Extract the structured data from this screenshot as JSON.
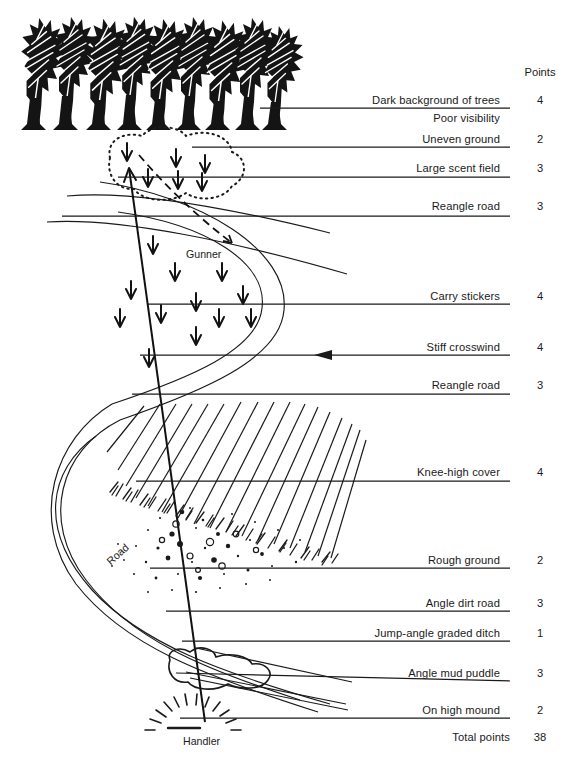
{
  "figure": {
    "title_column": "Points",
    "total_label": "Total points",
    "total_value": "38"
  },
  "legend_rows": [
    {
      "label": "Dark background of trees",
      "points": "4",
      "has_line": true,
      "label_y": 94,
      "line_y": 108,
      "label_right": 500
    },
    {
      "label": "Poor visibility",
      "points": "",
      "has_line": false,
      "label_y": 112,
      "line_y": 0,
      "label_right": 500
    },
    {
      "label": "Uneven ground",
      "points": "2",
      "has_line": true,
      "label_y": 133,
      "line_y": 147,
      "label_right": 500
    },
    {
      "label": "Large scent field",
      "points": "3",
      "has_line": true,
      "label_y": 162,
      "line_y": 177,
      "label_right": 500
    },
    {
      "label": "Reangle road",
      "points": "3",
      "has_line": true,
      "label_y": 200,
      "line_y": 216,
      "label_right": 500
    },
    {
      "label": "Carry stickers",
      "points": "4",
      "has_line": true,
      "label_y": 290,
      "line_y": 304,
      "label_right": 500
    },
    {
      "label": "Stiff crosswind",
      "points": "4",
      "has_line": true,
      "label_y": 341,
      "line_y": 355,
      "label_right": 500
    },
    {
      "label": "Reangle road",
      "points": "3",
      "has_line": true,
      "label_y": 379,
      "line_y": 394,
      "label_right": 500
    },
    {
      "label": "Knee-high cover",
      "points": "4",
      "has_line": true,
      "label_y": 466,
      "line_y": 481,
      "label_right": 500
    },
    {
      "label": "Rough ground",
      "points": "2",
      "has_line": true,
      "label_y": 554,
      "line_y": 568,
      "label_right": 500
    },
    {
      "label": "Angle dirt road",
      "points": "3",
      "has_line": true,
      "label_y": 597,
      "line_y": 611,
      "label_right": 500
    },
    {
      "label": "Jump-angle graded ditch",
      "points": "1",
      "has_line": true,
      "label_y": 627,
      "line_y": 641,
      "label_right": 500
    },
    {
      "label": "Angle mud puddle",
      "points": "3",
      "has_line": true,
      "label_y": 667,
      "line_y": 681,
      "label_right": 500
    },
    {
      "label": "On high mound",
      "points": "2",
      "has_line": true,
      "label_y": 704,
      "line_y": 718,
      "label_right": 500
    }
  ],
  "diagram_labels": [
    {
      "name": "gunner",
      "text": "Gunner",
      "x": 186,
      "y": 248,
      "rotate": 0
    },
    {
      "name": "road",
      "text": "Road",
      "x": 104,
      "y": 558,
      "rotate": -42
    },
    {
      "name": "handler",
      "text": "Handler",
      "x": 183,
      "y": 735,
      "rotate": 0
    }
  ],
  "chart_data": {
    "type": "table",
    "columns": [
      "Feature",
      "Points"
    ],
    "rows": [
      [
        "Dark background of trees",
        4
      ],
      [
        "Poor visibility",
        null
      ],
      [
        "Uneven ground",
        2
      ],
      [
        "Large scent field",
        3
      ],
      [
        "Reangle road",
        3
      ],
      [
        "Carry stickers",
        4
      ],
      [
        "Stiff crosswind",
        4
      ],
      [
        "Reangle road",
        3
      ],
      [
        "Knee-high cover",
        4
      ],
      [
        "Rough ground",
        2
      ],
      [
        "Angle dirt road",
        3
      ],
      [
        "Jump-angle graded ditch",
        1
      ],
      [
        "Angle mud puddle",
        3
      ],
      [
        "On high mound",
        2
      ]
    ],
    "total": 38,
    "values": [
      4,
      2,
      3,
      3,
      4,
      4,
      3,
      4,
      2,
      3,
      1,
      3,
      2
    ],
    "categories": [
      "Dark background of trees",
      "Uneven ground",
      "Large scent field",
      "Reangle road",
      "Carry stickers",
      "Stiff crosswind",
      "Reangle road",
      "Knee-high cover",
      "Rough ground",
      "Angle dirt road",
      "Jump-angle graded ditch",
      "Angle mud puddle",
      "On high mound"
    ]
  }
}
